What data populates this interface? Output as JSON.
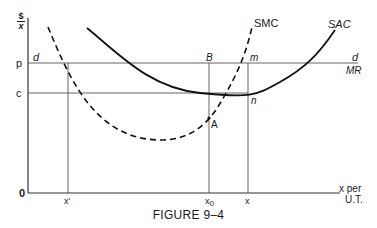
{
  "figure": {
    "caption": "FIGURE 9–4",
    "y_axis_label_top": "$",
    "y_axis_label_bottom": "x",
    "x_axis_label_line1": "x per",
    "x_axis_label_line2": "U.T.",
    "origin_label": "0",
    "price_label": "p",
    "cost_label": "c",
    "demand_label_left": "d",
    "demand_label_right": "d",
    "mr_label": "MR",
    "smc_label": "SMC",
    "sac_label": "SAC",
    "point_b": "B",
    "point_m": "m",
    "point_n": "n",
    "point_a": "A",
    "x_ticks": {
      "x_prime": "x′",
      "x0_base": "x",
      "x0_sub": "0",
      "x": "x"
    }
  },
  "colors": {
    "ink": "#1a1a1a",
    "thin_line": "#555555",
    "background": "#ffffff"
  }
}
